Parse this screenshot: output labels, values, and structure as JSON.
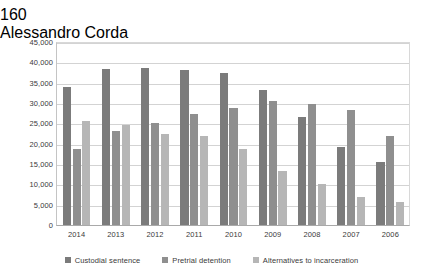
{
  "header": {
    "page_number": "160",
    "author": "Alessandro Corda"
  },
  "chart_data": {
    "type": "bar",
    "title": "",
    "subtitle": "",
    "xlabel": "",
    "ylabel": "",
    "categories": [
      "2014",
      "2013",
      "2012",
      "2011",
      "2010",
      "2009",
      "2008",
      "2007",
      "2006"
    ],
    "series": [
      {
        "name": "Custodial sentence",
        "color": "#7b7b7b",
        "values": [
          34000,
          38400,
          38500,
          38100,
          37400,
          33200,
          26600,
          19200,
          15400
        ]
      },
      {
        "name": "Pretrial detention",
        "color": "#8f8f8f",
        "values": [
          18700,
          23000,
          25000,
          27400,
          28700,
          30400,
          29800,
          28300,
          21900
        ]
      },
      {
        "name": "Alternatives to incarceration",
        "color": "#b6b6b6",
        "values": [
          25700,
          24700,
          22300,
          21900,
          18700,
          13200,
          10100,
          6900,
          5700
        ]
      }
    ],
    "ylim": [
      0,
      45000
    ],
    "ytick_values": [
      0,
      5000,
      10000,
      15000,
      20000,
      25000,
      30000,
      35000,
      40000,
      45000
    ],
    "ytick_labels": [
      "0",
      "5,000",
      "10,000",
      "15,000",
      "20,000",
      "25,000",
      "30,000",
      "35,000",
      "40,000",
      "45,000"
    ],
    "grid": true,
    "legend_position": "bottom"
  }
}
